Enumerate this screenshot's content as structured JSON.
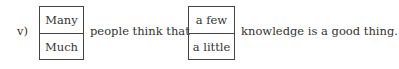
{
  "question": {
    "label": "v)",
    "choice_1": {
      "options": [
        "Many",
        "Much"
      ]
    },
    "text_middle": "people think that",
    "choice_2": {
      "options": [
        "a few",
        "a little"
      ]
    },
    "text_end": "knowledge is a good thing."
  },
  "colors": {
    "text": "#333333",
    "border": "#444444",
    "background": "#ffffff"
  }
}
